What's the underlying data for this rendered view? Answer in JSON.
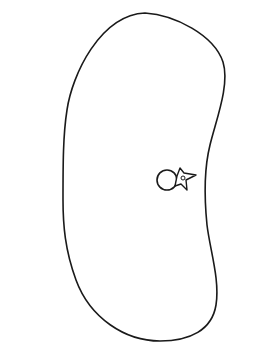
{
  "diagram": {
    "type": "flow-channel-with-closed-loop",
    "colors": {
      "stroke": "#1a1a1a",
      "background": "#ffffff"
    },
    "closed_loop": {
      "description": "Large closed bean-shaped curve crossing the flow channel"
    },
    "observer_icon": {
      "name": "observer-icon",
      "description": "Circle with small star/spur attachment containing a tiny ring"
    },
    "channel": {
      "top_line": {
        "x1": 12,
        "y1": 206,
        "x2": 260,
        "y2": 201
      },
      "bottom_line": {
        "x1": 13,
        "y1": 279,
        "x2": 257,
        "y2": 283
      }
    },
    "points": [
      {
        "id": "A",
        "label": "A",
        "x": 67,
        "y": 239,
        "label_x": 55,
        "label_y": 259
      },
      {
        "id": "B",
        "label": "B",
        "x": 139,
        "y": 239,
        "label_x": 136,
        "label_y": 259
      },
      {
        "id": "C",
        "label": "C",
        "x": 211,
        "y": 239,
        "label_x": 221,
        "label_y": 245
      }
    ],
    "flow_arrows": [
      {
        "x1": 14,
        "y1": 212,
        "x2": 88,
        "y2": 212
      },
      {
        "x1": 107,
        "y1": 215,
        "x2": 164,
        "y2": 215
      },
      {
        "x1": 175,
        "y1": 221,
        "x2": 214,
        "y2": 221
      },
      {
        "x1": 220,
        "y1": 216,
        "x2": 253,
        "y2": 216
      },
      {
        "x1": 14,
        "y1": 222,
        "x2": 100,
        "y2": 222
      },
      {
        "x1": 14,
        "y1": 233,
        "x2": 84,
        "y2": 233
      },
      {
        "x1": 100,
        "y1": 232,
        "x2": 157,
        "y2": 232
      },
      {
        "x1": 172,
        "y1": 239,
        "x2": 207,
        "y2": 239
      },
      {
        "x1": 222,
        "y1": 239,
        "x2": 257,
        "y2": 239
      },
      {
        "x1": 20,
        "y1": 245,
        "x2": 50,
        "y2": 245
      },
      {
        "x1": 76,
        "y1": 245,
        "x2": 110,
        "y2": 245
      },
      {
        "x1": 117,
        "y1": 248,
        "x2": 131,
        "y2": 248
      },
      {
        "x1": 152,
        "y1": 250,
        "x2": 170,
        "y2": 250
      },
      {
        "x1": 180,
        "y1": 254,
        "x2": 206,
        "y2": 254
      },
      {
        "x1": 17,
        "y1": 254,
        "x2": 48,
        "y2": 254
      },
      {
        "x1": 76,
        "y1": 254,
        "x2": 98,
        "y2": 254
      },
      {
        "x1": 117,
        "y1": 262,
        "x2": 134,
        "y2": 262
      },
      {
        "x1": 153,
        "y1": 262,
        "x2": 171,
        "y2": 262
      },
      {
        "x1": 20,
        "y1": 265,
        "x2": 109,
        "y2": 265
      },
      {
        "x1": 206,
        "y1": 266,
        "x2": 253,
        "y2": 266
      },
      {
        "x1": 24,
        "y1": 272,
        "x2": 98,
        "y2": 272
      },
      {
        "x1": 116,
        "y1": 273,
        "x2": 160,
        "y2": 273
      },
      {
        "x1": 179,
        "y1": 270,
        "x2": 211,
        "y2": 270
      }
    ]
  }
}
